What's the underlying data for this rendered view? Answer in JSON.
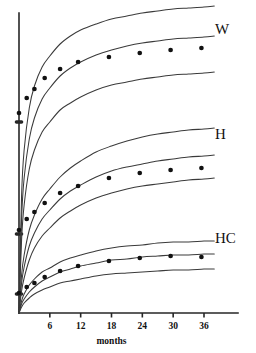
{
  "chart_data": {
    "type": "line",
    "title": "",
    "subtitle": "",
    "xlabel": "months",
    "ylabel": "",
    "xlim": [
      0,
      39
    ],
    "ylim": [
      0,
      1
    ],
    "grid": false,
    "legend_position": "right-inline",
    "x_ticks": [
      {
        "value": 6,
        "label": "6"
      },
      {
        "value": 12,
        "label": "12"
      },
      {
        "value": 18,
        "label": "18"
      },
      {
        "value": 24,
        "label": "24"
      },
      {
        "value": 30,
        "label": "30"
      },
      {
        "value": 36,
        "label": "36"
      }
    ],
    "y_tick_marks": [
      0.0635,
      0.2635,
      0.6365
    ],
    "annotations": [
      {
        "text": "W",
        "x": 37.2,
        "y_px": 34
      },
      {
        "text": "H",
        "x": 37.2,
        "y_px": 139
      },
      {
        "text": "HC",
        "x": 37.2,
        "y_px": 243
      }
    ],
    "groups": [
      {
        "name": "W",
        "label": "W",
        "label_x_px": 215,
        "label_y_px": 34,
        "series": [
          {
            "name": "W upper reference curve",
            "role": "upper",
            "x": [
              0,
              0.5,
              1,
              2,
              3,
              4.5,
              6,
              8,
              10,
              12,
              15,
              18,
              21,
              24,
              27,
              30,
              33,
              36,
              38
            ],
            "y_px": [
              313,
              196,
              150,
              108,
              86,
              67,
              56,
              44,
              36,
              30,
              24,
              19,
              16,
              13,
              11,
              9,
              8,
              7,
              6
            ]
          },
          {
            "name": "W median reference curve",
            "role": "median",
            "x": [
              0,
              0.5,
              1,
              2,
              3,
              4.5,
              6,
              8,
              10,
              12,
              15,
              18,
              21,
              24,
              27,
              30,
              33,
              36,
              38
            ],
            "y_px": [
              313,
              219,
              178,
              139,
              118,
              99,
              88,
              76,
              68,
              62,
              55,
              50,
              46,
              43,
              41,
              39,
              38,
              37,
              36
            ]
          },
          {
            "name": "W lower reference curve",
            "role": "lower",
            "x": [
              0,
              0.5,
              1,
              2,
              3,
              4.5,
              6,
              8,
              10,
              12,
              15,
              18,
              21,
              24,
              27,
              30,
              33,
              36,
              38
            ],
            "y_px": [
              313,
              240,
              205,
              169,
              150,
              132,
              122,
              110,
              103,
              97,
              90,
              85,
              82,
              79,
              77,
              75,
              74,
              73,
              72
            ]
          }
        ],
        "points": {
          "name": "W observed measurements",
          "x": [
            0,
            1.5,
            3,
            5,
            8,
            11.5,
            17.5,
            23.5,
            29.5,
            35.5
          ],
          "y_px": [
            113,
            98,
            89,
            78,
            69,
            62,
            57,
            53,
            50,
            48
          ]
        }
      },
      {
        "name": "H",
        "label": "H",
        "label_x_px": 215,
        "label_y_px": 139,
        "series": [
          {
            "name": "H upper reference curve",
            "role": "upper",
            "x": [
              0,
              0.5,
              1,
              2,
              3,
              4.5,
              6,
              8,
              10,
              12,
              15,
              18,
              21,
              24,
              27,
              30,
              33,
              36,
              38
            ],
            "y_px": [
              313,
              275,
              255,
              230,
              215,
              199,
              189,
              177,
              168,
              161,
              152,
              146,
              141,
              137,
              134,
              132,
              130,
              129,
              128
            ]
          },
          {
            "name": "H median reference curve",
            "role": "median",
            "x": [
              0,
              0.5,
              1,
              2,
              3,
              4.5,
              6,
              8,
              10,
              12,
              15,
              18,
              21,
              24,
              27,
              30,
              33,
              36,
              38
            ],
            "y_px": [
              313,
              283,
              267,
              246,
              233,
              219,
              210,
              199,
              191,
              185,
              177,
              171,
              167,
              164,
              161,
              159,
              157,
              156,
              155
            ]
          },
          {
            "name": "H lower reference curve",
            "role": "lower",
            "x": [
              0,
              0.5,
              1,
              2,
              3,
              4.5,
              6,
              8,
              10,
              12,
              15,
              18,
              21,
              24,
              27,
              30,
              33,
              36,
              38
            ],
            "y_px": [
              313,
              291,
              278,
              260,
              248,
              236,
              228,
              218,
              211,
              205,
              198,
              193,
              189,
              186,
              184,
              182,
              180,
              179,
              178
            ]
          }
        ],
        "points": {
          "name": "H observed measurements",
          "x": [
            0,
            1.5,
            3,
            5,
            8,
            11.5,
            17.5,
            23.5,
            29.5,
            35.5
          ],
          "y_px": [
            230,
            219,
            212,
            203,
            193,
            186,
            178,
            173,
            170,
            168
          ]
        }
      },
      {
        "name": "HC",
        "label": "HC",
        "label_x_px": 215,
        "label_y_px": 243,
        "series": [
          {
            "name": "HC upper reference curve",
            "role": "upper",
            "x": [
              0,
              0.5,
              1,
              2,
              3,
              4.5,
              6,
              8,
              10,
              12,
              15,
              18,
              21,
              24,
              27,
              30,
              33,
              36,
              38
            ],
            "y_px": [
              313,
              301,
              294,
              285,
              279,
              272,
              268,
              262,
              258,
              255,
              251,
              248,
              246,
              245,
              243,
              242,
              242,
              241,
              241
            ]
          },
          {
            "name": "HC median reference curve",
            "role": "median",
            "x": [
              0,
              0.5,
              1,
              2,
              3,
              4.5,
              6,
              8,
              10,
              12,
              15,
              18,
              21,
              24,
              27,
              30,
              33,
              36,
              38
            ],
            "y_px": [
              313,
              304,
              299,
              292,
              287,
              281,
              277,
              272,
              269,
              266,
              263,
              260,
              259,
              257,
              256,
              255,
              255,
              254,
              254
            ]
          },
          {
            "name": "HC lower reference curve",
            "role": "lower",
            "x": [
              0,
              0.5,
              1,
              2,
              3,
              4.5,
              6,
              8,
              10,
              12,
              15,
              18,
              21,
              24,
              27,
              30,
              33,
              36,
              38
            ],
            "y_px": [
              313,
              307,
              303,
              298,
              294,
              290,
              287,
              283,
              281,
              279,
              276,
              274,
              273,
              272,
              271,
              270,
              270,
              269,
              269
            ]
          }
        ],
        "points": {
          "name": "HC observed measurements",
          "x": [
            0,
            1.5,
            3,
            5,
            8,
            11.5,
            17.5,
            23.5,
            29.5,
            35.5
          ],
          "y_px": [
            293,
            287,
            283,
            277,
            271,
            266,
            261,
            258,
            256,
            257
          ]
        }
      }
    ]
  },
  "axes": {
    "origin_x_px": 19,
    "origin_y_px": 313,
    "x_axis_end_px": 238,
    "y_axis_top_px": 13,
    "months_label": "months"
  }
}
